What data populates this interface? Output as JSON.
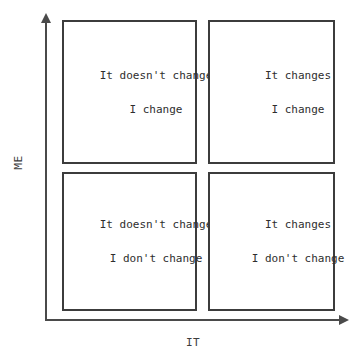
{
  "axes": {
    "y_label": "ME",
    "x_label": "IT"
  },
  "quadrants": {
    "top_left": {
      "line1": "It doesn't change",
      "line2": "I change"
    },
    "top_right": {
      "line1": "It changes",
      "line2": "I change"
    },
    "bottom_left": {
      "line1": "It doesn't change",
      "line2": "I don't change"
    },
    "bottom_right": {
      "line1": "It changes",
      "line2": "I don't change"
    }
  },
  "colors": {
    "border": "#3c3c3c",
    "axis": "#4a4a4a",
    "text": "#2e2e2e",
    "background": "#ffffff"
  }
}
